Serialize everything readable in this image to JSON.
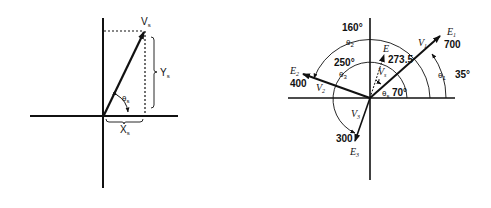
{
  "left_figure": {
    "vector_label": "V",
    "vector_sub": "s",
    "y_label": "Y",
    "y_sub": "s",
    "x_label": "X",
    "x_sub": "s",
    "angle_label": "θ",
    "angle_sub": "s"
  },
  "right_figure": {
    "e1": {
      "label": "E",
      "sub": "1",
      "v": "V",
      "vsub": "1",
      "magnitude": "700",
      "angle_label": "θ",
      "angle_sub": "1",
      "angle": "35°"
    },
    "e2": {
      "label": "E",
      "sub": "2",
      "v": "V",
      "vsub": "2",
      "magnitude": "400",
      "angle_label": "θ",
      "angle_sub": "2",
      "angle": "160°"
    },
    "e3": {
      "label": "E",
      "sub": "3",
      "v": "V",
      "vsub": "3",
      "magnitude": "300",
      "angle_label": "θ",
      "angle_sub": "3",
      "angle": "250°"
    },
    "resultant": {
      "label": "E",
      "v": "V",
      "vsub": "s",
      "magnitude": "273.5",
      "angle_label": "θ",
      "angle_sub": "s",
      "angle": "70°"
    }
  }
}
